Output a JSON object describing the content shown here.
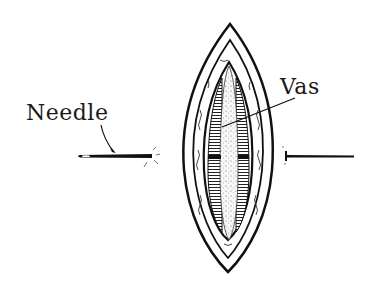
{
  "diagram": {
    "labels": {
      "needle": "Needle",
      "vas": "Vas"
    },
    "colors": {
      "ink": "#111111",
      "background": "#ffffff",
      "tissue": "#f4f4f4"
    }
  }
}
